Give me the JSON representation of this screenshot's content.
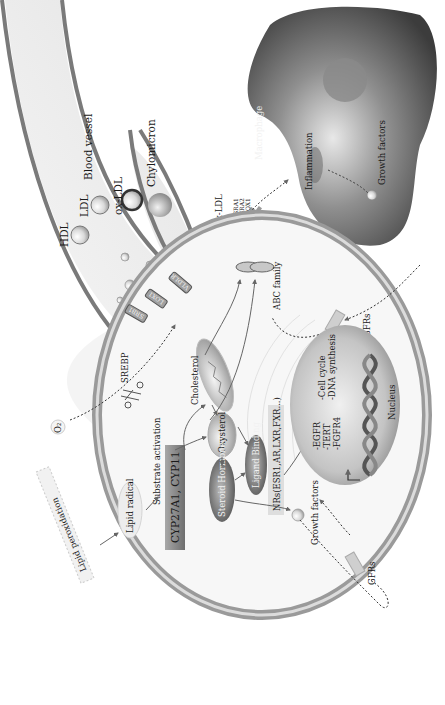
{
  "diagram": {
    "orientation": "rotated 90deg clockwise (text reads bottom-to-top)",
    "blood_vessel": {
      "label": "Blood vessel",
      "particles": {
        "hdl": "HDL",
        "ldl": "LDL",
        "ox_ldl": "ox-LDL",
        "chylomicron": "Chylomicron"
      }
    },
    "macrophage": {
      "label": "Macrophage",
      "inflammation": "Inflammation",
      "growth_factors": "Growth factors",
      "receptors": [
        "SRA1",
        "SRA2",
        "LOX1"
      ]
    },
    "extracellular": {
      "ox_ldl": "ox-LDL",
      "ldl": "LDL",
      "o2": "O₂",
      "gfrs_top": "GFRs",
      "gfrs_bottom": "GFRs"
    },
    "cell": {
      "membrane_receptors": [
        "SRB1",
        "LOX1",
        "VLDLR"
      ],
      "abc_family": "ABC family",
      "srebp": "SREBP",
      "lipid_peroxidation": "Lipid peroxidation",
      "lipid_radical": "Lipid radical",
      "substrate_activation": "Substrate activation",
      "enzymes": "CYP27A1, CYP11",
      "cholesterol": "Cholesterol",
      "oxysterol": "Oxysterol",
      "steroid_hormone": "Steroid Hormone",
      "ligand_binding": "Ligand Binding",
      "nuclear_receptors": "NRs(ESR1,AR,LXR,FXR...)",
      "growth_factors": "Growth factors"
    },
    "nucleus": {
      "label": "Nucleus",
      "targets": [
        "-EGFR",
        "-TERT",
        "-FGFR4"
      ],
      "processes": [
        "-Cell cycle",
        "-DNA synthesis"
      ]
    }
  }
}
